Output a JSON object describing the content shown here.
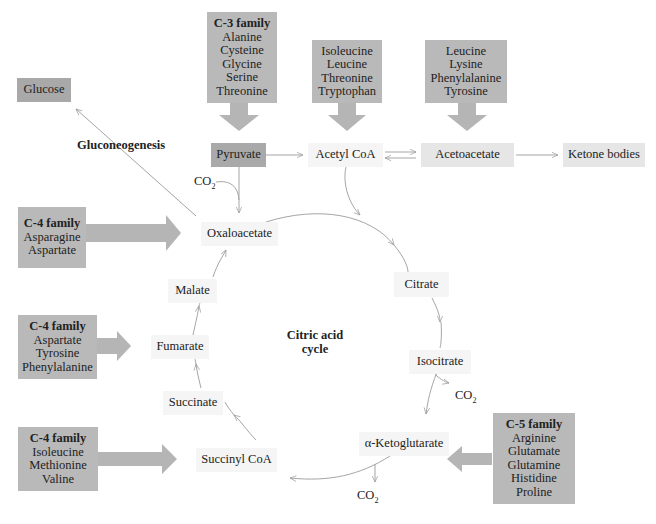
{
  "diagram": {
    "title": "Citric acid cycle",
    "title_line1": "Citric acid",
    "title_line2": "cycle",
    "gluconeogenesis_label": "Gluconeogenesis",
    "co2_label": "CO",
    "co2_sub": "2",
    "metabolites": {
      "glucose": "Glucose",
      "pyruvate": "Pyruvate",
      "acetyl_coa": "Acetyl CoA",
      "acetoacetate": "Acetoacetate",
      "ketone_bodies": "Ketone bodies",
      "oxaloacetate": "Oxaloacetate",
      "citrate": "Citrate",
      "isocitrate": "Isocitrate",
      "alpha_ketoglutarate": "α-Ketoglutarate",
      "succinyl_coa": "Succinyl CoA",
      "succinate": "Succinate",
      "fumarate": "Fumarate",
      "malate": "Malate"
    },
    "families": [
      {
        "title": "C-3 family",
        "members": [
          "Alanine",
          "Cysteine",
          "Glycine",
          "Serine",
          "Threonine"
        ],
        "target": "Pyruvate"
      },
      {
        "title": "",
        "members": [
          "Isoleucine",
          "Leucine",
          "Threonine",
          "Tryptophan"
        ],
        "target": "Acetyl CoA"
      },
      {
        "title": "",
        "members": [
          "Leucine",
          "Lysine",
          "Phenylalanine",
          "Tyrosine"
        ],
        "target": "Acetoacetate"
      },
      {
        "title": "C-4 family",
        "members": [
          "Asparagine",
          "Aspartate"
        ],
        "target": "Oxaloacetate"
      },
      {
        "title": "C-4 family",
        "members": [
          "Aspartate",
          "Tyrosine",
          "Phenylalanine"
        ],
        "target": "Fumarate"
      },
      {
        "title": "C-4 family",
        "members": [
          "Isoleucine",
          "Methionine",
          "Valine"
        ],
        "target": "Succinyl CoA"
      },
      {
        "title": "C-5 family",
        "members": [
          "Arginine",
          "Glutamate",
          "Glutamine",
          "Histidine",
          "Proline"
        ],
        "target": "α-Ketoglutarate"
      }
    ]
  }
}
